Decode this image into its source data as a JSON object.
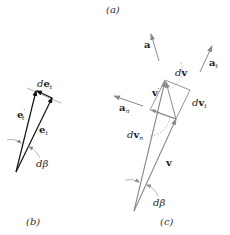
{
  "figure": {
    "panels": [
      {
        "id": "a",
        "caption": "(a)"
      },
      {
        "id": "b",
        "caption": "(b)"
      },
      {
        "id": "c",
        "caption": "(c)"
      }
    ],
    "panel_b": {
      "vectors": [
        {
          "name": "e_t_prime",
          "label_main": "e",
          "label_sub": "t",
          "label_prime": "′"
        },
        {
          "name": "e_t",
          "label_main": "e",
          "label_sub": "t"
        },
        {
          "name": "de_t",
          "label_d": "d",
          "label_main": "e",
          "label_sub": "t"
        }
      ],
      "angle": {
        "label_d": "d",
        "label_sym": "β"
      }
    },
    "panel_c": {
      "vectors": [
        {
          "name": "a",
          "label_main": "a"
        },
        {
          "name": "a_t",
          "label_main": "a",
          "label_sub": "t"
        },
        {
          "name": "a_n",
          "label_main": "a",
          "label_sub": "n"
        },
        {
          "name": "v_prime",
          "label_main": "v",
          "label_prime": "′"
        },
        {
          "name": "v",
          "label_main": "v"
        },
        {
          "name": "dv",
          "label_d": "d",
          "label_main": "v"
        },
        {
          "name": "dv_t",
          "label_d": "d",
          "label_main": "v",
          "label_sub": "t"
        },
        {
          "name": "dv_n",
          "label_d": "d",
          "label_main": "v",
          "label_sub": "n"
        }
      ],
      "angle": {
        "label_d": "d",
        "label_sym": "β"
      }
    },
    "colors": {
      "panel_b_lines": "#111111",
      "panel_c_lines": "#8a8a8a",
      "guide_lines": "#9a9a9a",
      "text": "#222222"
    }
  }
}
